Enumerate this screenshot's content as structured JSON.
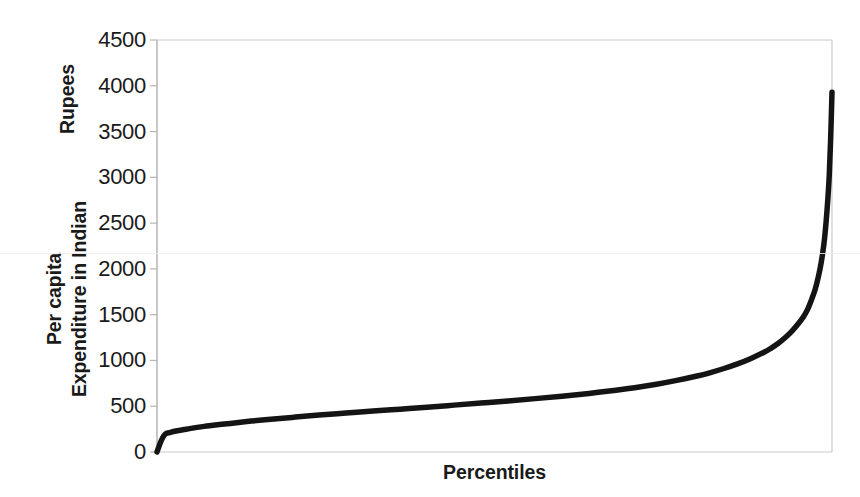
{
  "chart_data": {
    "type": "line",
    "title": "",
    "subtitle": "",
    "xlabel": "Percentiles",
    "ylabel": "Per capita Expenditure in Indian Rupees",
    "ylabel_lines": [
      "Per capita Expenditure in Indian",
      "Rupees"
    ],
    "xlim": [
      0,
      100
    ],
    "ylim": [
      0,
      4500
    ],
    "yticks": [
      0,
      500,
      1000,
      1500,
      2000,
      2500,
      3000,
      3500,
      4000,
      4500
    ],
    "ytick_labels": [
      "0",
      "500",
      "1000",
      "1500",
      "2000",
      "2500",
      "3000",
      "3500",
      "4000",
      "4500"
    ],
    "xticks": [],
    "xtick_labels": [],
    "grid": false,
    "legend": false,
    "legend_position": "none",
    "line_color": "#141414",
    "line_width": 5.5,
    "series": [
      {
        "name": "Per capita expenditure by percentile",
        "x": [
          0,
          0.6,
          1.2,
          2,
          3,
          4,
          5,
          7,
          10,
          13,
          16,
          20,
          24,
          28,
          32,
          36,
          40,
          44,
          48,
          52,
          56,
          60,
          64,
          68,
          71,
          74,
          77,
          80,
          82,
          84,
          86,
          88,
          90,
          91,
          92,
          93,
          94,
          95,
          95.8,
          96.4,
          97,
          97.5,
          98,
          98.4,
          98.8,
          99.1,
          99.4,
          99.6,
          99.8,
          100
        ],
        "y": [
          0,
          120,
          195,
          215,
          232,
          245,
          258,
          280,
          305,
          330,
          352,
          378,
          403,
          425,
          447,
          468,
          489,
          512,
          535,
          558,
          583,
          610,
          640,
          675,
          705,
          740,
          782,
          830,
          868,
          912,
          962,
          1022,
          1092,
          1135,
          1185,
          1245,
          1315,
          1400,
          1480,
          1560,
          1670,
          1775,
          1920,
          2070,
          2270,
          2490,
          2780,
          3030,
          3420,
          3930
        ]
      }
    ],
    "annotations": []
  },
  "axis": {
    "x_label_text": "Percentiles",
    "y_title_line1": "Per capita Expenditure in Indian",
    "y_title_line2": "Rupees",
    "border_color": "#c9c9cc",
    "tick_color": "#b5b5b8"
  }
}
